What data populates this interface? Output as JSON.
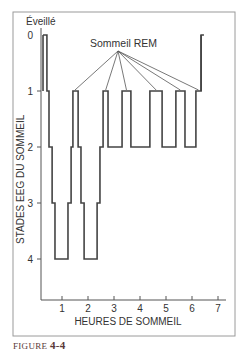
{
  "chart_data": {
    "type": "line",
    "subtype": "step",
    "title": "",
    "xlabel": "HEURES DE SOMMEIL",
    "ylabel": "STADES EEG DU SOMMEIL",
    "xlim": [
      0,
      7.3
    ],
    "ylim": [
      0,
      4
    ],
    "y_inverted": true,
    "x_ticks": [
      1,
      2,
      3,
      4,
      5,
      6,
      7
    ],
    "y_ticks": [
      0,
      1,
      2,
      3,
      4
    ],
    "y_top_label": "Éveillé",
    "grid": false,
    "annotation": {
      "text": "Sommeil REM",
      "points_to_stage": 1,
      "targets_hours": [
        1.5,
        2.68,
        3.48,
        4.62,
        5.55,
        6.25
      ]
    },
    "series": [
      {
        "name": "hypnogram",
        "steps": [
          {
            "start": 0.27,
            "end": 0.42,
            "stage": 0
          },
          {
            "start": 0.42,
            "end": 0.5,
            "stage": 1
          },
          {
            "start": 0.5,
            "end": 0.62,
            "stage": 2
          },
          {
            "start": 0.62,
            "end": 0.73,
            "stage": 3
          },
          {
            "start": 0.73,
            "end": 1.23,
            "stage": 4
          },
          {
            "start": 1.23,
            "end": 1.35,
            "stage": 3
          },
          {
            "start": 1.35,
            "end": 1.42,
            "stage": 2
          },
          {
            "start": 1.42,
            "end": 1.62,
            "stage": 1
          },
          {
            "start": 1.62,
            "end": 1.73,
            "stage": 2
          },
          {
            "start": 1.73,
            "end": 1.85,
            "stage": 3
          },
          {
            "start": 1.85,
            "end": 2.35,
            "stage": 4
          },
          {
            "start": 2.35,
            "end": 2.46,
            "stage": 3
          },
          {
            "start": 2.46,
            "end": 2.58,
            "stage": 2
          },
          {
            "start": 2.58,
            "end": 2.77,
            "stage": 1
          },
          {
            "start": 2.77,
            "end": 3.31,
            "stage": 2
          },
          {
            "start": 3.31,
            "end": 3.65,
            "stage": 1
          },
          {
            "start": 3.65,
            "end": 4.38,
            "stage": 2
          },
          {
            "start": 4.38,
            "end": 4.85,
            "stage": 1
          },
          {
            "start": 4.85,
            "end": 5.38,
            "stage": 2
          },
          {
            "start": 5.38,
            "end": 5.73,
            "stage": 1
          },
          {
            "start": 5.73,
            "end": 6.15,
            "stage": 2
          },
          {
            "start": 6.15,
            "end": 6.35,
            "stage": 1
          },
          {
            "start": 6.35,
            "end": 6.46,
            "stage": 0
          }
        ]
      }
    ]
  },
  "caption": {
    "label": "FIGURE",
    "number": "4-4"
  }
}
